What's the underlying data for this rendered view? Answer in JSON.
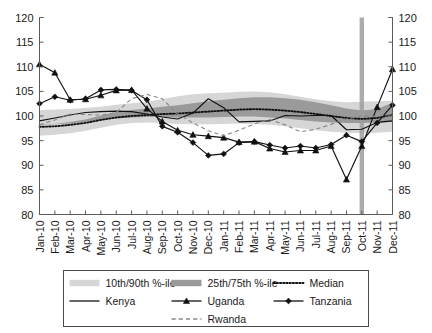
{
  "chart_data": {
    "type": "line",
    "title": "",
    "xlabel": "",
    "ylabel": "",
    "ylim": [
      80,
      120
    ],
    "y_ticks": [
      80,
      85,
      90,
      95,
      100,
      105,
      110,
      115,
      120
    ],
    "grid": false,
    "legend_position": "bottom",
    "dual_y_axis": true,
    "categories": [
      "Jan-10",
      "Feb-10",
      "Mar-10",
      "Apr-10",
      "May-10",
      "Jun-10",
      "Jul-10",
      "Aug-10",
      "Sep-10",
      "Oct-10",
      "Nov-10",
      "Dec-10",
      "Jan-11",
      "Feb-11",
      "Mar-11",
      "Apr-11",
      "May-11",
      "Jun-11",
      "Jul-11",
      "Aug-11",
      "Sep-11",
      "Oct-11",
      "Nov-11",
      "Dec-11"
    ],
    "annotations": [
      {
        "type": "vertical-band",
        "label": "Oct-11",
        "x_index": 21,
        "color": "#9e9e9e"
      }
    ],
    "bands": [
      {
        "name": "10th/90th %-ile",
        "color": "#d6d6d6",
        "lower": [
          96.0,
          96.2,
          96.5,
          97.0,
          97.6,
          98.2,
          98.6,
          98.7,
          98.6,
          98.4,
          98.3,
          98.3,
          98.4,
          98.5,
          98.4,
          98.2,
          97.9,
          97.5,
          97.1,
          96.8,
          96.6,
          96.5,
          96.6,
          96.8
        ],
        "upper": [
          101.2,
          101.3,
          101.4,
          101.6,
          101.9,
          102.3,
          102.6,
          102.9,
          103.4,
          104.0,
          104.4,
          104.6,
          104.7,
          104.9,
          105.0,
          104.8,
          104.4,
          103.9,
          103.4,
          103.0,
          102.8,
          102.9,
          103.0,
          103.1
        ]
      },
      {
        "name": "25th/75th %-ile",
        "color": "#9a9a9a",
        "lower": [
          98.2,
          98.3,
          98.5,
          98.8,
          99.2,
          99.5,
          99.7,
          99.8,
          99.8,
          99.7,
          99.7,
          99.7,
          99.8,
          99.9,
          99.9,
          99.7,
          99.5,
          99.2,
          98.9,
          98.7,
          98.6,
          98.6,
          98.7,
          98.8
        ]
      }
    ],
    "series": [
      {
        "name": "Median",
        "style": "dotted",
        "color": "#111111",
        "values": [
          97.8,
          97.9,
          98.2,
          98.6,
          99.2,
          99.7,
          100.0,
          100.2,
          100.4,
          100.5,
          100.7,
          100.9,
          101.1,
          101.3,
          101.4,
          101.3,
          101.1,
          100.8,
          100.4,
          100.0,
          99.6,
          99.4,
          99.6,
          100.3
        ]
      },
      {
        "name": "Kenya",
        "style": "solid",
        "color": "#111111",
        "marker": "none",
        "values": [
          99.0,
          99.6,
          100.2,
          100.7,
          100.9,
          101.0,
          100.9,
          100.4,
          99.8,
          99.4,
          100.6,
          103.5,
          101.7,
          98.8,
          98.9,
          99.0,
          100.1,
          100.0,
          100.1,
          100.1,
          97.2,
          97.3,
          98.7,
          99.0
        ]
      },
      {
        "name": "Uganda",
        "style": "solid",
        "color": "#111111",
        "marker": "triangle",
        "values": [
          110.5,
          108.8,
          103.3,
          103.4,
          104.2,
          105.2,
          105.3,
          101.5,
          98.9,
          97.1,
          96.2,
          95.9,
          95.6,
          94.7,
          94.8,
          93.4,
          92.7,
          93.0,
          93.0,
          93.9,
          87.1,
          93.9,
          101.8,
          109.5
        ]
      },
      {
        "name": "Tanzania",
        "style": "solid",
        "color": "#111111",
        "marker": "diamond",
        "values": [
          102.5,
          103.9,
          103.2,
          103.5,
          105.3,
          105.4,
          105.2,
          103.3,
          97.9,
          96.7,
          94.6,
          92.0,
          92.3,
          94.6,
          94.8,
          94.1,
          93.5,
          93.9,
          93.5,
          94.2,
          96.1,
          94.8,
          98.6,
          102.2
        ]
      },
      {
        "name": "Rwanda",
        "style": "dashed",
        "color": "#8a8a8a",
        "marker": "none",
        "values": [
          98.2,
          99.2,
          100.4,
          100.3,
          100.2,
          100.7,
          103.5,
          104.4,
          103.5,
          100.4,
          98.6,
          97.0,
          96.0,
          97.1,
          98.4,
          99.3,
          98.2,
          96.8,
          97.3,
          98.3,
          99.4,
          100.0,
          99.9,
          100.4
        ]
      }
    ]
  },
  "axes": {
    "left_labels": [
      "120",
      "115",
      "110",
      "105",
      "100",
      "95",
      "90",
      "85",
      "80"
    ],
    "right_labels": [
      "120",
      "115",
      "110",
      "105",
      "100",
      "95",
      "90",
      "85",
      "80"
    ]
  },
  "legend": {
    "rows": [
      [
        {
          "label": "10th/90th %-ile",
          "swatch": "band-light"
        },
        {
          "label": "25th/75th %-ile",
          "swatch": "band-dark"
        },
        {
          "label": "Median",
          "swatch": "line-dotted"
        }
      ],
      [
        {
          "label": "Kenya",
          "swatch": "line-solid"
        },
        {
          "label": "Uganda",
          "swatch": "line-triangle"
        },
        {
          "label": "Tanzania",
          "swatch": "line-diamond"
        }
      ],
      [
        {
          "label": "Rwanda",
          "swatch": "line-dashed"
        }
      ]
    ]
  }
}
